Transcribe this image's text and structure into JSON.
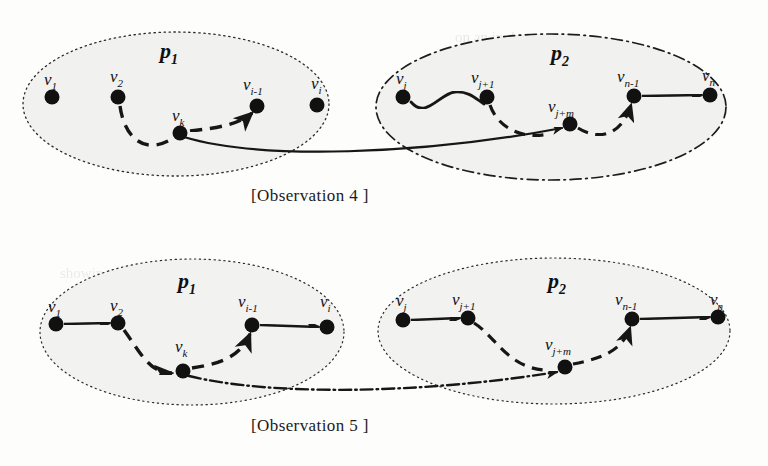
{
  "figure": {
    "kind": "two-panel graph diagram",
    "background_color": "#fdfdfb",
    "ink_color": "#151515",
    "region_fill": "#f0f0ee",
    "panels": [
      {
        "id": "observation-4",
        "caption": "[Observation 4 ]",
        "groups": [
          {
            "id": "p1-top",
            "label": "p",
            "label_sub": "1",
            "border_style": "dotted",
            "cx": 176,
            "cy": 104,
            "rx": 153,
            "ry": 72
          },
          {
            "id": "p2-top",
            "label": "p",
            "label_sub": "2",
            "border_style": "dash-dot",
            "cx": 551,
            "cy": 107,
            "rx": 175,
            "ry": 73
          }
        ],
        "nodes": [
          {
            "id": "v1",
            "label": "v",
            "sub": "1",
            "x": 52,
            "y": 97,
            "lx": 46,
            "ly": 80
          },
          {
            "id": "v2",
            "label": "v",
            "sub": "2",
            "x": 118,
            "y": 97,
            "lx": 111,
            "ly": 78
          },
          {
            "id": "vk",
            "label": "v",
            "sub": "k",
            "x": 180,
            "y": 133,
            "lx": 173,
            "ly": 116
          },
          {
            "id": "vi-1",
            "label": "v",
            "sub": "i-1",
            "x": 257,
            "y": 106,
            "lx": 245,
            "ly": 86
          },
          {
            "id": "vi",
            "label": "v",
            "sub": "i",
            "x": 317,
            "y": 105,
            "lx": 312,
            "ly": 85
          },
          {
            "id": "vj",
            "label": "v",
            "sub": "j",
            "x": 403,
            "y": 97,
            "lx": 396,
            "ly": 79
          },
          {
            "id": "vj+1",
            "label": "v",
            "sub": "j+1",
            "x": 487,
            "y": 97,
            "lx": 473,
            "ly": 79
          },
          {
            "id": "vj+m",
            "label": "v",
            "sub": "j+m",
            "x": 570,
            "y": 124,
            "lx": 553,
            "ly": 106
          },
          {
            "id": "vn-1",
            "label": "v",
            "sub": "n-1",
            "x": 634,
            "y": 96,
            "lx": 620,
            "ly": 78
          },
          {
            "id": "vn",
            "label": "v",
            "sub": "n",
            "x": 710,
            "y": 95,
            "lx": 703,
            "ly": 77
          }
        ],
        "edges": [
          {
            "from": "v1",
            "to": "v2",
            "style": "solid",
            "arrow": true
          },
          {
            "from": "v2",
            "to": "vk",
            "style": "dashed",
            "arrow": false
          },
          {
            "from": "vk",
            "to": "vi-1",
            "style": "dashed",
            "arrow": true
          },
          {
            "from": "vi-1",
            "to": "vi",
            "style": "solid",
            "arrow": true
          },
          {
            "from": "vj",
            "to": "vj+1",
            "style": "solid",
            "arrow": false
          },
          {
            "from": "vj+1",
            "to": "vj+m",
            "style": "dashed",
            "arrow": false
          },
          {
            "from": "vj+m",
            "to": "vn-1",
            "style": "dashed",
            "arrow": true
          },
          {
            "from": "vn-1",
            "to": "vn",
            "style": "solid",
            "arrow": true
          },
          {
            "from": "vk",
            "to": "vj+m",
            "style": "solid",
            "arrow": true,
            "cross_group": true
          }
        ]
      },
      {
        "id": "observation-5",
        "caption": "[Observation 5 ]",
        "groups": [
          {
            "id": "p1-bottom",
            "label": "p",
            "label_sub": "1",
            "border_style": "dotted",
            "cx": 192,
            "cy": 332,
            "rx": 152,
            "ry": 73
          },
          {
            "id": "p2-bottom",
            "label": "p",
            "label_sub": "2",
            "border_style": "dotted",
            "cx": 554,
            "cy": 331,
            "rx": 176,
            "ry": 73
          }
        ],
        "nodes": [
          {
            "id": "v1",
            "label": "v",
            "sub": "1",
            "x": 56,
            "y": 324,
            "lx": 49,
            "ly": 306
          },
          {
            "id": "v2",
            "label": "v",
            "sub": "2",
            "x": 118,
            "y": 323,
            "lx": 111,
            "ly": 305
          },
          {
            "id": "vk",
            "label": "v",
            "sub": "k",
            "x": 183,
            "y": 371,
            "lx": 176,
            "ly": 344
          },
          {
            "id": "vi-1",
            "label": "v",
            "sub": "i-1",
            "x": 252,
            "y": 325,
            "lx": 240,
            "ly": 299
          },
          {
            "id": "vi",
            "label": "v",
            "sub": "i",
            "x": 327,
            "y": 327,
            "lx": 320,
            "ly": 300
          },
          {
            "id": "vj",
            "label": "v",
            "sub": "j",
            "x": 403,
            "y": 320,
            "lx": 396,
            "ly": 298
          },
          {
            "id": "vj+1",
            "label": "v",
            "sub": "j+1",
            "x": 468,
            "y": 318,
            "lx": 454,
            "ly": 297
          },
          {
            "id": "vj+m",
            "label": "v",
            "sub": "j+m",
            "x": 565,
            "y": 367,
            "lx": 548,
            "ly": 340
          },
          {
            "id": "vn-1",
            "label": "v",
            "sub": "n-1",
            "x": 632,
            "y": 319,
            "lx": 618,
            "ly": 297
          },
          {
            "id": "vn",
            "label": "v",
            "sub": "n",
            "x": 718,
            "y": 317,
            "lx": 711,
            "ly": 297
          }
        ],
        "edges": [
          {
            "from": "v1",
            "to": "v2",
            "style": "solid",
            "arrow": true
          },
          {
            "from": "v2",
            "to": "vk",
            "style": "dashed",
            "arrow": true
          },
          {
            "from": "vk",
            "to": "vi-1",
            "style": "dashed",
            "arrow": true
          },
          {
            "from": "vi-1",
            "to": "vi",
            "style": "solid",
            "arrow": true
          },
          {
            "from": "vj",
            "to": "vj+1",
            "style": "solid",
            "arrow": true
          },
          {
            "from": "vj+1",
            "to": "vj+m",
            "style": "dashed",
            "arrow": false
          },
          {
            "from": "vj+m",
            "to": "vn-1",
            "style": "dashed",
            "arrow": true
          },
          {
            "from": "vn-1",
            "to": "vn",
            "style": "solid",
            "arrow": true
          },
          {
            "from": "vk",
            "to": "vj+m",
            "style": "dash-dot",
            "arrow": true,
            "cross_group": true
          }
        ]
      }
    ]
  },
  "labels": {
    "p1_top": "p",
    "p1_top_sub": "1",
    "p2_top": "p",
    "p2_top_sub": "2",
    "p1_bottom": "p",
    "p1_bottom_sub": "1",
    "p2_bottom": "p",
    "p2_bottom_sub": "2",
    "caption_top": "[Observation 4 ]",
    "caption_bottom": "[Observation 5 ]",
    "v": "v",
    "sub_1": "1",
    "sub_2": "2",
    "sub_k": "k",
    "sub_i_minus_1": "i-1",
    "sub_i": "i",
    "sub_j": "j",
    "sub_j_plus_1": "j+1",
    "sub_j_plus_m": "j+m",
    "sub_n_minus_1": "n-1",
    "sub_n": "n"
  },
  "bleed_through_text": {
    "line1": "on an in that non",
    "line2": "similar to the pages",
    "line3": "showing the tree p",
    "line4": "v should that",
    "line5": "of systems and constru",
    "line6": "translates are as"
  }
}
